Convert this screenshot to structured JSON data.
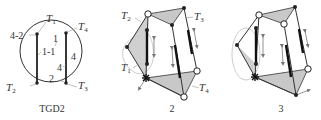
{
  "figure": {
    "panels": [
      {
        "id": "tgd2",
        "caption": "TGD2",
        "labels": {
          "t1": "T",
          "t1_sub": "1",
          "t2": "T",
          "t2_sub": "2",
          "t3": "T",
          "t3_sub": "3",
          "t4": "T",
          "t4_sub": "4",
          "edge_4_2": "4-2",
          "edge_1": "1",
          "edge_1_1": "1-1",
          "edge_4_right": "4",
          "edge_4_inner": "4",
          "edge_2": "2"
        }
      },
      {
        "id": "panel-2",
        "caption": "2",
        "labels": {
          "t1": "T",
          "t1_sub": "1",
          "t2": "T",
          "t2_sub": "2",
          "t3": "T",
          "t3_sub": "3",
          "t4": "T",
          "t4_sub": "4"
        }
      },
      {
        "id": "panel-3",
        "caption": "3"
      }
    ],
    "colors": {
      "stroke": "#222222",
      "thin_stroke": "#555555",
      "shade": "#c8c8c8",
      "arrow": "#777777",
      "guide": "#aaaaaa"
    }
  }
}
